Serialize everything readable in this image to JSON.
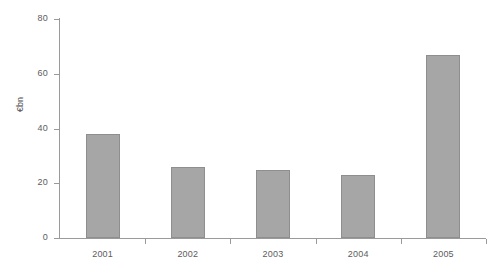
{
  "chart_data": {
    "type": "bar",
    "title": "",
    "subtitle": "",
    "xlabel": "",
    "ylabel": "€bn",
    "categories": [
      "2001",
      "2002",
      "2003",
      "2004",
      "2005"
    ],
    "values": [
      38,
      26,
      25,
      23,
      67
    ],
    "series": [
      {
        "name": "€bn",
        "values": [
          38,
          26,
          25,
          23,
          67
        ]
      }
    ],
    "ylim": [
      0,
      80
    ],
    "yticks": [
      0,
      20,
      40,
      60,
      80
    ],
    "ytick_labels": [
      "0",
      "20",
      "40",
      "60",
      "80"
    ],
    "grid": false,
    "legend": false,
    "legend_position": "none",
    "annotations": [],
    "colors": {
      "bar_fill": "#a6a6a6",
      "bar_border": "#8e8e8e",
      "axis": "#9a9a9a",
      "tick_label": "#5c5c5c",
      "axis_title": "#4a4a4a",
      "background": "#ffffff"
    }
  }
}
